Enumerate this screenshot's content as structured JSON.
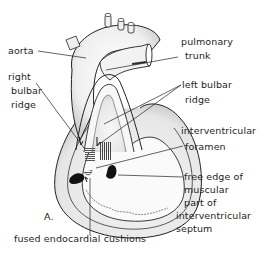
{
  "figure": {
    "panel_label": "A.",
    "labels": {
      "aorta": "aorta",
      "pulmonary_trunk_line1": "pulmonary",
      "pulmonary_trunk_line2": "trunk",
      "right_bulbar_ridge_line1": "right",
      "right_bulbar_ridge_line2": "bulbar",
      "right_bulbar_ridge_line3": "ridge",
      "left_bulbar_ridge_line1": "left bulbar",
      "left_bulbar_ridge_line2": "ridge",
      "interventricular_foramen_line1": "interventricular",
      "interventricular_foramen_line2": "foramen",
      "free_edge_line1": "free edge of",
      "free_edge_line2": "muscular",
      "free_edge_line3": "part of",
      "free_edge_line4": "interventricular",
      "free_edge_line5": "septum",
      "fused_cushions": "fused endocardial cushions"
    },
    "colors": {
      "background": "#ffffff",
      "ink": "#1e1e1e",
      "shading": "#9a9a9a"
    }
  }
}
